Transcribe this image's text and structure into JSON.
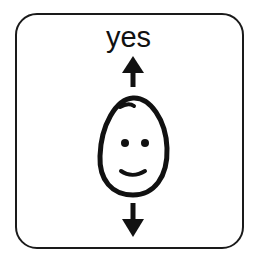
{
  "symbol": {
    "label": "yes",
    "description": "nodding head pictogram",
    "icons": [
      "arrow-up-icon",
      "smiling-face-icon",
      "arrow-down-icon"
    ]
  },
  "colors": {
    "stroke": "#111111",
    "border": "#1a1a1a",
    "background": "#ffffff"
  }
}
